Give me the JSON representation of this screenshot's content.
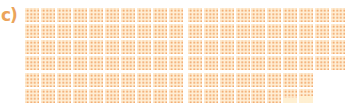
{
  "panel_label": "c)",
  "colors": {
    "dot": "#F0A060",
    "background": "#FFEFD6",
    "label": "#EBA45A"
  },
  "layout": {
    "rows": 3,
    "columns_per_row": 10,
    "group_size": 5,
    "block_structure": "2x2 sub-grids of 10x10 dots"
  },
  "rows": [
    {
      "full_blocks": 10,
      "partial_fraction": 0
    },
    {
      "full_blocks": 10,
      "partial_fraction": 0
    },
    {
      "full_blocks": 8,
      "partial_fraction": 0.7
    }
  ],
  "total_blocks": 28.7
}
